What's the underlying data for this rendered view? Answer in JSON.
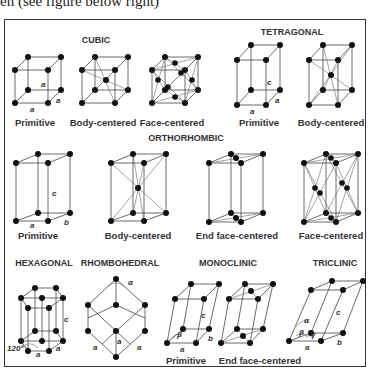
{
  "caption": "en (see figure below right)",
  "systems": {
    "cubic": {
      "title": "CUBIC",
      "variants": [
        "Primitive",
        "Body-centered",
        "Face-centered"
      ],
      "axes": [
        "a",
        "a",
        "a"
      ]
    },
    "tetragonal": {
      "title": "TETRAGONAL",
      "variants": [
        "Primitive",
        "Body-centered"
      ],
      "axes": [
        "a",
        "a",
        "c"
      ]
    },
    "orthorhombic": {
      "title": "ORTHORHOMBIC",
      "variants": [
        "Primitive",
        "Body-centered",
        "End face-centered",
        "Face-centered"
      ],
      "axes": [
        "a",
        "b",
        "c"
      ]
    },
    "hexagonal": {
      "title": "HEXAGONAL",
      "axes": [
        "a",
        "a",
        "c"
      ],
      "angle": "120°"
    },
    "rhombohedral": {
      "title": "RHOMBOHEDRAL",
      "axes": [
        "a",
        "a",
        "a"
      ],
      "angle": "α"
    },
    "monoclinic": {
      "title": "MONOCLINIC",
      "variants": [
        "Primitive",
        "End face-centered"
      ],
      "axes": [
        "a",
        "b",
        "c"
      ],
      "angle": "β"
    },
    "triclinic": {
      "title": "TRICLINIC",
      "axes": [
        "a",
        "b",
        "c"
      ],
      "angles": [
        "α",
        "β",
        "γ"
      ]
    }
  },
  "colors": {
    "line": "#444444",
    "atom": "#111111",
    "text": "#333333",
    "border": "#333333"
  }
}
